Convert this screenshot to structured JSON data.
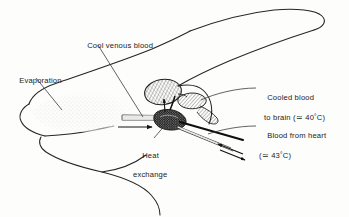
{
  "figure": {
    "style": "monochrome line drawing with hatching and stipple",
    "background_color": "#fdfdfc",
    "ink_color": "#1b1b1b",
    "width_px": 349,
    "height_px": 217
  },
  "labels": {
    "evaporation": "Evaporation",
    "cool_venous_blood": "Cool venous blood",
    "heat_exchange_line1": "Heat",
    "heat_exchange_line2": "exchange",
    "cooled_blood_line1": "Cooled blood",
    "cooled_blood_line2_pre": "to brain (",
    "cooled_blood_approx": "≃",
    "cooled_blood_value": " 40",
    "cooled_blood_degree": "°",
    "cooled_blood_unit": "C)",
    "blood_heart_line1": "Blood from heart",
    "blood_heart_line2_pre": "(",
    "blood_heart_approx": "≃",
    "blood_heart_value": " 43",
    "blood_heart_degree": "°",
    "blood_heart_unit": "C)"
  },
  "temperatures": {
    "brain_blood_c": 40,
    "heart_blood_c": 43,
    "unit": "°C",
    "approx_symbol": "≃"
  },
  "anatomy": {
    "brain": "hatched-oval",
    "cavernous_sinus": "hatched-elongated-lobe",
    "carotid_rete": "dark-stippled-blob",
    "venous_vessel": "hollow-outlined-tube-from-nasal-region",
    "arterial_vessel": "solid-dark-line-from-heart",
    "nasal_evaporation_zone": "faint-stipple"
  },
  "flow_arrows": {
    "evaporative_inflow": "arrow-pointing-right-into-rete",
    "venous_return": "short-arrow-upward-at-rete",
    "countercurrent_pair": "two-opposed-arrows-lower-right"
  }
}
